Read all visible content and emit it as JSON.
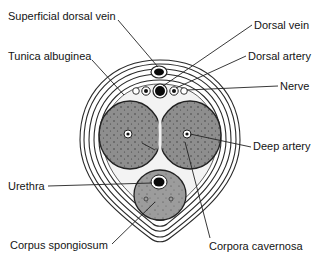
{
  "diagram": {
    "labels": {
      "superficial_dorsal_vein": "Superficial dorsal vein",
      "tunica_albuginea": "Tunica albuginea",
      "dorsal_vein": "Dorsal vein",
      "dorsal_artery": "Dorsal artery",
      "nerve": "Nerve",
      "deep_artery": "Deep artery",
      "urethra": "Urethra",
      "corpus_spongiosum": "Corpus spongiosum",
      "corpora_cavernosa": "Corpora cavernosa"
    },
    "colors": {
      "tissue_fill": "#8c8c8c",
      "spongiosum_fill": "#9a9a9a",
      "line": "#222222",
      "background": "#ffffff"
    }
  }
}
